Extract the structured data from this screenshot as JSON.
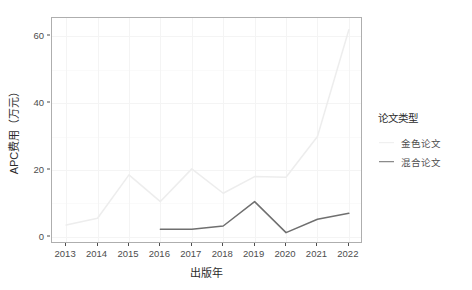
{
  "chart_data": {
    "type": "line",
    "title": "",
    "xlabel": "出版年",
    "ylabel": "APC费用（万元）",
    "x": [
      2013,
      2014,
      2015,
      2016,
      2017,
      2018,
      2019,
      2020,
      2021,
      2022
    ],
    "xtick_labels": [
      "2013",
      "2014",
      "2015",
      "2016",
      "2017",
      "2018",
      "2019",
      "2020",
      "2021",
      "2022"
    ],
    "ytick_labels": [
      "0",
      "20",
      "40",
      "60"
    ],
    "yticks": [
      0,
      20,
      40,
      60
    ],
    "ylim": [
      -2.2,
      65.5
    ],
    "xlim": [
      2012.55,
      2022.45
    ],
    "grid": true,
    "legend_position": "right",
    "legend_title": "论文类型",
    "series": [
      {
        "name": "金色论文",
        "color": "#ededed",
        "x": [
          2013,
          2014,
          2015,
          2016,
          2017,
          2018,
          2019,
          2020,
          2021,
          2022
        ],
        "values": [
          3.5,
          5.5,
          18.5,
          10.5,
          20.3,
          13.0,
          18.0,
          17.8,
          30.0,
          62.0
        ]
      },
      {
        "name": "混合论文",
        "color": "#6f6f6f",
        "x": [
          2016,
          2017,
          2018,
          2019,
          2020,
          2021,
          2022
        ],
        "values": [
          2.2,
          2.2,
          3.2,
          10.5,
          1.2,
          5.2,
          7.0
        ]
      }
    ]
  },
  "style": {
    "panel_border": "#aeaeae",
    "grid_color": "#f4f4f4",
    "axis_text": "#4d4d4d",
    "title_text": "#2b2b2b",
    "background": "#ffffff"
  }
}
